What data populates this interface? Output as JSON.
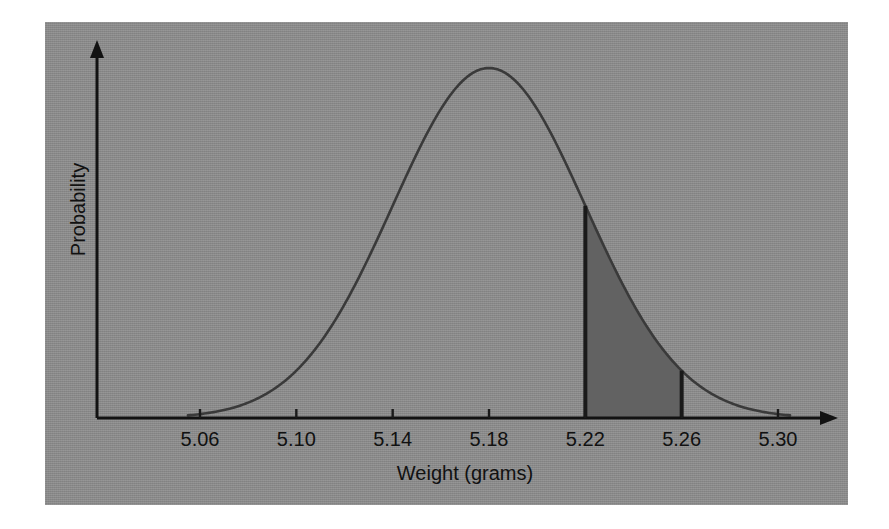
{
  "figure": {
    "panel_background_color": "#8d8d8d",
    "page_background_color": "#ffffff",
    "ink_color": "#1a1a1a",
    "curve_color": "#3a3a3a",
    "shaded_region_color": "#626262"
  },
  "axes": {
    "x_title": "Weight (grams)",
    "y_title": "Probability",
    "x_tick_labels": [
      "5.06",
      "5.10",
      "5.14",
      "5.18",
      "5.22",
      "5.26",
      "5.30"
    ],
    "y_tick_labels": []
  },
  "chart_data": {
    "type": "line",
    "title": "",
    "subtitle": "",
    "xlabel": "Weight (grams)",
    "ylabel": "Probability",
    "xlim": [
      5.04,
      5.32
    ],
    "ylim": [
      0,
      1.08
    ],
    "grid": false,
    "legend": null,
    "legend_position": "none",
    "distribution": {
      "kind": "normal",
      "mean": 5.18,
      "std_dev": 0.04,
      "peak_x": 5.18
    },
    "x_ticks": [
      5.06,
      5.1,
      5.14,
      5.18,
      5.22,
      5.26,
      5.3
    ],
    "x_tick_labels": [
      "5.06",
      "5.10",
      "5.14",
      "5.18",
      "5.22",
      "5.26",
      "5.30"
    ],
    "series": [
      {
        "name": "Normal probability density",
        "x": [
          5.04,
          5.06,
          5.08,
          5.1,
          5.12,
          5.14,
          5.16,
          5.18,
          5.2,
          5.22,
          5.24,
          5.26,
          5.28,
          5.3,
          5.32
        ],
        "values": [
          0.004,
          0.014,
          0.044,
          0.105,
          0.223,
          0.405,
          0.684,
          1.0,
          0.684,
          0.405,
          0.223,
          0.105,
          0.044,
          0.014,
          0.004
        ]
      }
    ],
    "shaded_region": {
      "label": "",
      "x_start": 5.22,
      "x_end": 5.26,
      "y_at_x_start": 0.405,
      "y_at_x_end": 0.105,
      "fill_color": "#626262",
      "boundary_lines": true
    },
    "annotations": []
  }
}
